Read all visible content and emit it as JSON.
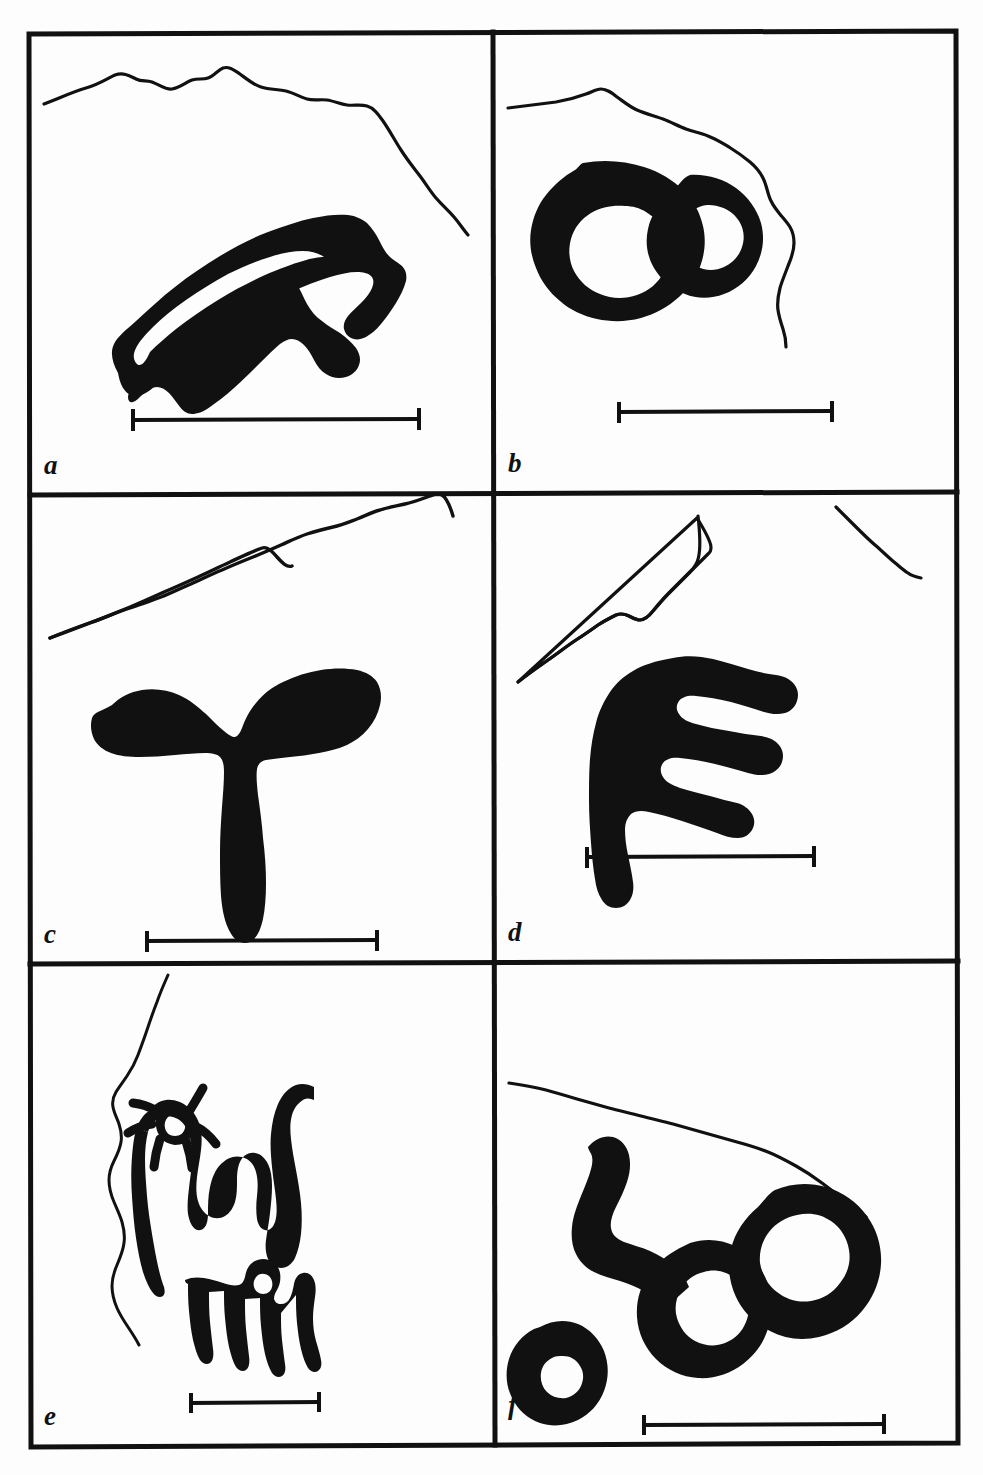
{
  "figure": {
    "panel_count": 6,
    "layout": "2 columns x 3 rows",
    "ink_color": "#111111",
    "background_color": "#fdfdfd",
    "frame_color": "#111111",
    "caption_fragment": ""
  },
  "panels": [
    {
      "id": "a",
      "label": "a",
      "row": 1,
      "column": 1,
      "motif": "nested-arc-outline",
      "motif_description": "Thick double arc / chevron outline, open at bottom left",
      "contour": "ridge-line descending to the right",
      "scale_bar": {
        "x1": 132,
        "x2": 420,
        "y": 420
      }
    },
    {
      "id": "b",
      "label": "b",
      "row": 1,
      "column": 2,
      "motif": "double-ring",
      "motif_description": "Solid mass enclosing two white voids, figure-eight form",
      "contour": "ridge-line curving down at right",
      "scale_bar": {
        "x1": 618,
        "x2": 833,
        "y": 412
      }
    },
    {
      "id": "c",
      "label": "c",
      "row": 2,
      "column": 1,
      "motif": "anchor-form",
      "motif_description": "Solid Y / anchor shape with two upper lobes and vertical stem",
      "contour": "ridge-line rising to the right",
      "scale_bar": {
        "x1": 146,
        "x2": 378,
        "y": 941
      }
    },
    {
      "id": "d",
      "label": "d",
      "row": 2,
      "column": 2,
      "motif": "comb-form",
      "motif_description": "Solid comb / hand with three horizontal prongs and a downward thumb",
      "contour": "two ridge-line segments, left rising and right descending",
      "scale_bar": {
        "x1": 586,
        "x2": 815,
        "y": 857
      }
    },
    {
      "id": "e",
      "label": "e",
      "row": 3,
      "column": 1,
      "motif": "anthropomorph-and-quadruped",
      "motif_description": "Outline anthropomorph with rayed head above a small outline quadruped",
      "contour": "near-vertical ridge-line on the left",
      "scale_bar": {
        "x1": 190,
        "x2": 320,
        "y": 1403
      }
    },
    {
      "id": "f",
      "label": "f",
      "row": 3,
      "column": 2,
      "motif": "interlocking-loops",
      "motif_description": "Heavy interlocking loops with a hook arm and a separate small ring at lower left",
      "contour": "ridge-line descending gently to the right",
      "scale_bar": {
        "x1": 643,
        "x2": 885,
        "y": 1425
      }
    }
  ]
}
